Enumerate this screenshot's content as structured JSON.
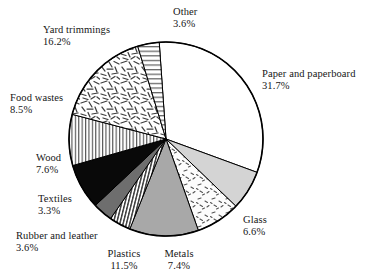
{
  "chart_data": {
    "type": "pie",
    "title": "",
    "subtitle": "",
    "xlabel": "",
    "ylabel": "",
    "legend_position": "outside-labels",
    "grid": false,
    "units": "percent",
    "start_angle_deg": -4,
    "direction": "clockwise",
    "categories": [
      "Paper and paperboard",
      "Glass",
      "Metals",
      "Plastics",
      "Rubber and leather",
      "Textiles",
      "Wood",
      "Food wastes",
      "Yard trimmings",
      "Other"
    ],
    "values": [
      31.7,
      6.6,
      7.4,
      11.5,
      3.6,
      3.3,
      7.6,
      8.5,
      16.2,
      3.6
    ],
    "value_labels": [
      "31.7%",
      "6.6%",
      "7.4%",
      "11.5%",
      "3.6%",
      "3.3%",
      "7.6%",
      "8.5%",
      "16.2%",
      "3.6%"
    ],
    "total": 100.0,
    "slices": [
      {
        "name": "Paper and paperboard",
        "value": 31.7,
        "value_label": "31.7%",
        "fill": "#ffffff",
        "pattern": "solid-white",
        "label_x": 262,
        "label_y": 68,
        "align": "left"
      },
      {
        "name": "Glass",
        "value": 6.6,
        "value_label": "6.6%",
        "fill": "#d4d4d4",
        "pattern": "solid-light-gray",
        "label_x": 243,
        "label_y": 214,
        "align": "left"
      },
      {
        "name": "Metals",
        "value": 7.4,
        "value_label": "7.4%",
        "fill": "#fbfbfb",
        "pattern": "speckle-dash",
        "label_x": 179,
        "label_y": 248,
        "align": "center"
      },
      {
        "name": "Plastics",
        "value": 11.5,
        "value_label": "11.5%",
        "fill": "#a8a8a8",
        "pattern": "solid-mid-gray",
        "label_x": 124,
        "label_y": 248,
        "align": "center"
      },
      {
        "name": "Rubber and leather",
        "value": 3.6,
        "value_label": "3.6%",
        "fill": "#ffffff",
        "pattern": "vertical-stripes",
        "label_x": 16,
        "label_y": 230,
        "align": "left"
      },
      {
        "name": "Textiles",
        "value": 3.3,
        "value_label": "3.3%",
        "fill": "#6e6e6e",
        "pattern": "solid-dark-gray",
        "label_x": 38,
        "label_y": 193,
        "align": "left"
      },
      {
        "name": "Wood",
        "value": 7.6,
        "value_label": "7.6%",
        "fill": "#090909",
        "pattern": "solid-black",
        "label_x": 36,
        "label_y": 152,
        "align": "left"
      },
      {
        "name": "Food wastes",
        "value": 8.5,
        "value_label": "8.5%",
        "fill": "#ffffff",
        "pattern": "fine-vertical-lines",
        "label_x": 10,
        "label_y": 92,
        "align": "left"
      },
      {
        "name": "Yard trimmings",
        "value": 16.2,
        "value_label": "16.2%",
        "fill": "#ffffff",
        "pattern": "random-dashes",
        "label_x": 43,
        "label_y": 24,
        "align": "left"
      },
      {
        "name": "Other",
        "value": 3.6,
        "value_label": "3.6%",
        "fill": "#ffffff",
        "pattern": "horizontal-lines",
        "label_x": 173,
        "label_y": 6,
        "align": "left"
      }
    ],
    "geometry": {
      "center_x": 166,
      "center_y": 139,
      "radius": 97,
      "outline_color": "#000000",
      "outline_width": 1.6
    }
  }
}
